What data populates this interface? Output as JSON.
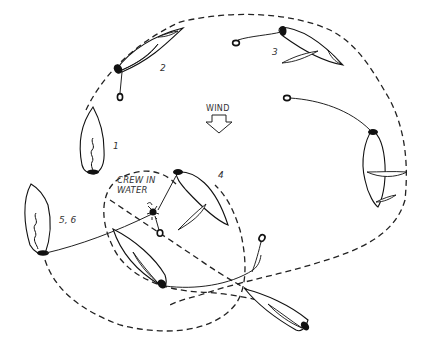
{
  "diagram": {
    "type": "sailing-maneuver",
    "wind_label": "WIND",
    "crew_label_line1": "CREW IN",
    "crew_label_line2": "WATER",
    "positions": [
      {
        "id": "1",
        "label": "1"
      },
      {
        "id": "2",
        "label": "2"
      },
      {
        "id": "3",
        "label": "3"
      },
      {
        "id": "4",
        "label": "4"
      },
      {
        "id": "5-6",
        "label": "5, 6"
      }
    ],
    "colors": {
      "ink": "#111111",
      "background": "#ffffff",
      "label": "#333333"
    }
  }
}
